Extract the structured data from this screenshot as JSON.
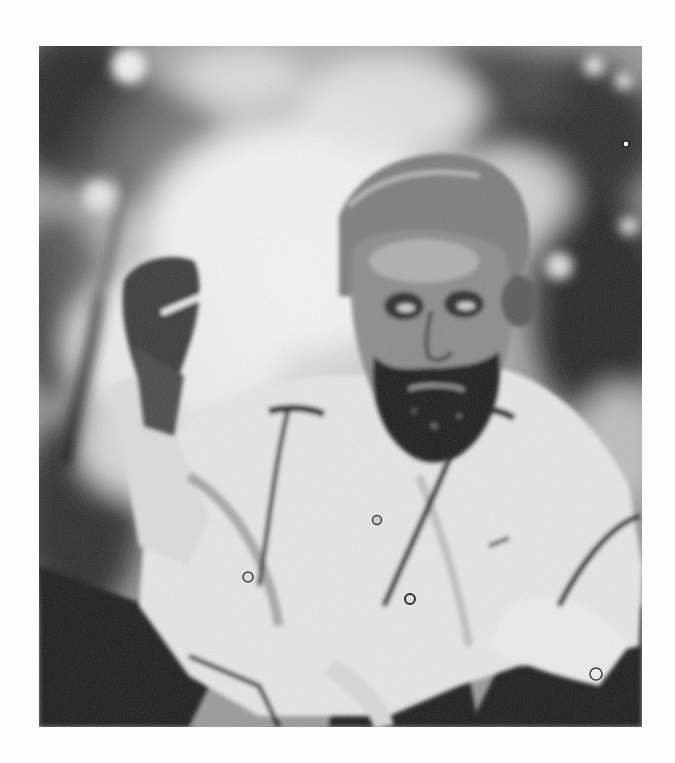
{
  "image": {
    "kind": "photograph",
    "color_mode": "black-and-white",
    "subject": "bearded man seated outdoors holding a cigarette in raised right hand",
    "background": "blurred foliage / trees",
    "clothing": "light-colored open-collar shirt with buttoned cuffs, light jacket",
    "frame": {
      "x": 39,
      "y": 46,
      "width": 603,
      "height": 681
    },
    "page_background": "#fdfdfd",
    "tones": {
      "dark": "#1a1a1a",
      "mid": "#7a7a7a",
      "light": "#e8e8e8",
      "highlight": "#f6f6f6"
    }
  }
}
